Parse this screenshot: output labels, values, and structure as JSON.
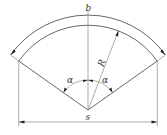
{
  "diagram": {
    "type": "sector-arc-geometry",
    "labels": {
      "arc_length": "b",
      "chord": "s",
      "radius": "R",
      "angle_left": "α",
      "angle_right": "α"
    },
    "colors": {
      "line": "#555555",
      "text": "#333333",
      "background": "#ffffff"
    },
    "geometry": {
      "center": [
        88,
        110
      ],
      "inner_radius": 85,
      "outer_radius": 95,
      "half_angle_deg": 54.6,
      "angle_arc_radius": 30
    }
  }
}
